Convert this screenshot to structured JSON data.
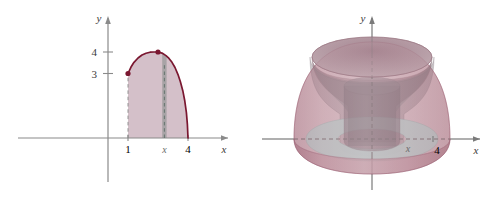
{
  "figure": {
    "title": "",
    "background_color": "#ffffff",
    "panels": [
      {
        "id": "plane-region",
        "name": "2d-region-panel",
        "axes": {
          "x_label": "x",
          "y_label": "y",
          "x_ticks": [
            {
              "value": 1,
              "label": "1"
            },
            {
              "value": 2.82,
              "label": "x"
            },
            {
              "value": 4,
              "label": "4"
            }
          ],
          "y_ticks": [
            {
              "value": 3,
              "label": "3"
            },
            {
              "value": 4,
              "label": "4"
            }
          ],
          "x_range": [
            -1.6,
            6.2
          ],
          "y_range": [
            -2.6,
            5.1
          ]
        },
        "points": [
          {
            "x": 1,
            "y": 3,
            "label": ""
          },
          {
            "x": 2.5,
            "y": 4,
            "label": ""
          }
        ],
        "shaded_region": {
          "from_x": 1,
          "to_x": 4,
          "fill_color": "#cdb5c0"
        },
        "curve_color": "#7a1730",
        "strip": {
          "at_x": 2.82,
          "width": 0.22,
          "fill_color": "#9a9a9a"
        }
      },
      {
        "id": "solid-of-revolution",
        "name": "3d-solid-panel",
        "axes": {
          "x_label": "x",
          "y_label": "y",
          "x_ticks": [
            {
              "value": 2.82,
              "label": "x"
            },
            {
              "value": 4,
              "label": "4"
            }
          ]
        },
        "colors": {
          "outer_shell": "#b4808f",
          "outer_shell_dark": "#9d6073",
          "inner_cavity": "#8e8289",
          "inner_cylinder": "#8a7a82",
          "base_disk": "#bfdcd8",
          "axis": "#6b6b6b"
        }
      }
    ]
  },
  "chart_data": {
    "type": "area",
    "title": "",
    "xlabel": "x",
    "ylabel": "y",
    "xlim": [
      -1.6,
      6.2
    ],
    "ylim": [
      -2.6,
      5.1
    ],
    "grid": false,
    "legend": null,
    "xticks": [
      1,
      4
    ],
    "xticklabels": [
      "1",
      "4"
    ],
    "yticks": [
      3,
      4
    ],
    "yticklabels": [
      "3",
      "4"
    ],
    "annotations": [
      {
        "text": "x",
        "x": 2.82,
        "y": -0.45,
        "kind": "x-tick-variable"
      }
    ],
    "series": [
      {
        "name": "boundary-curve",
        "type": "line",
        "color": "#7a1730",
        "description": "downward-opening curve from (1,3) rising to vertex (2.5,4) then falling to (4,0)",
        "x": [
          1.0,
          1.15,
          1.3,
          1.5,
          1.7,
          1.9,
          2.1,
          2.3,
          2.5,
          2.7,
          2.9,
          3.05,
          3.2,
          3.35,
          3.5,
          3.62,
          3.74,
          3.84,
          3.92,
          3.97,
          4.0
        ],
        "y": [
          3.0,
          3.3,
          3.52,
          3.72,
          3.86,
          3.94,
          3.99,
          4.0,
          4.0,
          3.95,
          3.83,
          3.7,
          3.52,
          3.28,
          2.95,
          2.62,
          2.2,
          1.72,
          1.18,
          0.62,
          0.0
        ]
      },
      {
        "name": "shaded-region",
        "type": "area",
        "color": "#cdb5c0",
        "description": "region bounded above by curve, below by x-axis, left by x=1, right by x=4"
      },
      {
        "name": "representative-strip",
        "type": "bar",
        "color": "#9a9a9a",
        "x": [
          2.82
        ],
        "width": 0.22,
        "description": "vertical representative rectangle at x"
      }
    ],
    "markers": [
      {
        "x": 1,
        "y": 3,
        "color": "#7a1730"
      },
      {
        "x": 2.5,
        "y": 4,
        "color": "#7a1730"
      }
    ]
  }
}
